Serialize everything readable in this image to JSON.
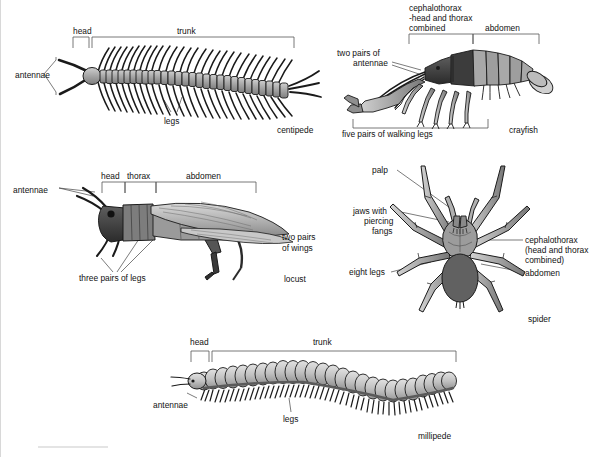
{
  "figure": {
    "background": "#ffffff",
    "ink": "#111111",
    "bracket_color": "#555555"
  },
  "palette": {
    "dark": "#4a4a4a",
    "mid": "#8a8a8a",
    "light": "#b8b8b8",
    "pale": "#d4d4d4",
    "outline": "#1a1a1a"
  },
  "panels": [
    {
      "id": "centipede",
      "name": "centipede",
      "caption": "centipede",
      "brackets": [
        {
          "label": "head",
          "x1": 72,
          "x2": 88
        },
        {
          "label": "trunk",
          "x1": 91,
          "x2": 293
        }
      ],
      "labels": [
        {
          "text": "antennae",
          "x": 14,
          "y": 74
        },
        {
          "text": "legs",
          "x": 163,
          "y": 120
        }
      ]
    },
    {
      "id": "crayfish",
      "name": "crayfish",
      "caption": "crayfish",
      "brackets": [
        {
          "label": "cephalothorax\n-head and thorax\ncombined",
          "x1": 408,
          "x2": 472
        },
        {
          "label": "abdomen",
          "x1": 472,
          "x2": 538
        }
      ],
      "labels": [
        {
          "text": "two pairs of",
          "x": 336,
          "y": 52
        },
        {
          "text": "antennae",
          "x": 352,
          "y": 62
        },
        {
          "text": "five pairs of walking legs",
          "x": 365,
          "y": 131
        }
      ]
    },
    {
      "id": "locust",
      "name": "locust",
      "caption": "locust",
      "brackets": [
        {
          "label": "head",
          "x1": 101,
          "x2": 124
        },
        {
          "label": "thorax",
          "x1": 124,
          "x2": 155
        },
        {
          "label": "abdomen",
          "x1": 155,
          "x2": 255
        }
      ],
      "labels": [
        {
          "text": "antennae",
          "x": 12,
          "y": 190
        },
        {
          "text": "two pairs",
          "x": 279,
          "y": 236
        },
        {
          "text": "of wings",
          "x": 279,
          "y": 246
        },
        {
          "text": "three pairs of legs",
          "x": 80,
          "y": 278
        }
      ]
    },
    {
      "id": "spider",
      "name": "spider",
      "caption": "spider",
      "brackets": [],
      "labels": [
        {
          "text": "palp",
          "x": 372,
          "y": 170
        },
        {
          "text": "jaws with",
          "x": 352,
          "y": 210
        },
        {
          "text": "piercing",
          "x": 360,
          "y": 220
        },
        {
          "text": "fangs",
          "x": 371,
          "y": 230
        },
        {
          "text": "eight legs",
          "x": 350,
          "y": 271
        },
        {
          "text": "cephalothorax",
          "x": 526,
          "y": 239
        },
        {
          "text": "(head and thorax",
          "x": 526,
          "y": 249
        },
        {
          "text": "combined)",
          "x": 526,
          "y": 259
        },
        {
          "text": "abdomen",
          "x": 526,
          "y": 272
        }
      ]
    },
    {
      "id": "millipede",
      "name": "millipede",
      "caption": "millipede",
      "brackets": [
        {
          "label": "head",
          "x1": 190,
          "x2": 208
        },
        {
          "label": "trunk",
          "x1": 211,
          "x2": 455
        }
      ],
      "labels": [
        {
          "text": "antennae",
          "x": 152,
          "y": 404
        },
        {
          "text": "legs",
          "x": 283,
          "y": 419
        }
      ]
    }
  ],
  "captions": {
    "centipede": "centipede",
    "crayfish": "crayfish",
    "locust": "locust",
    "spider": "spider",
    "millipede": "millipede"
  },
  "bracket_labels": {
    "head": "head",
    "trunk": "trunk",
    "thorax": "thorax",
    "abdomen": "abdomen",
    "cephalothorax_line1": "cephalothorax",
    "cephalothorax_line2": "-head and thorax",
    "cephalothorax_line3": "combined"
  },
  "leader_labels": {
    "antennae": "antennae",
    "legs": "legs",
    "two_pairs_of": "two pairs of",
    "five_pairs_walking_legs": "five pairs of walking legs",
    "two_pairs": "two pairs",
    "of_wings": "of wings",
    "three_pairs_of_legs": "three pairs of legs",
    "palp": "palp",
    "jaws_with": "jaws with",
    "piercing": "piercing",
    "fangs": "fangs",
    "eight_legs": "eight legs",
    "ceph_l1": "cephalothorax",
    "ceph_l2": "(head and thorax",
    "ceph_l3": "combined)",
    "abdomen": "abdomen"
  }
}
